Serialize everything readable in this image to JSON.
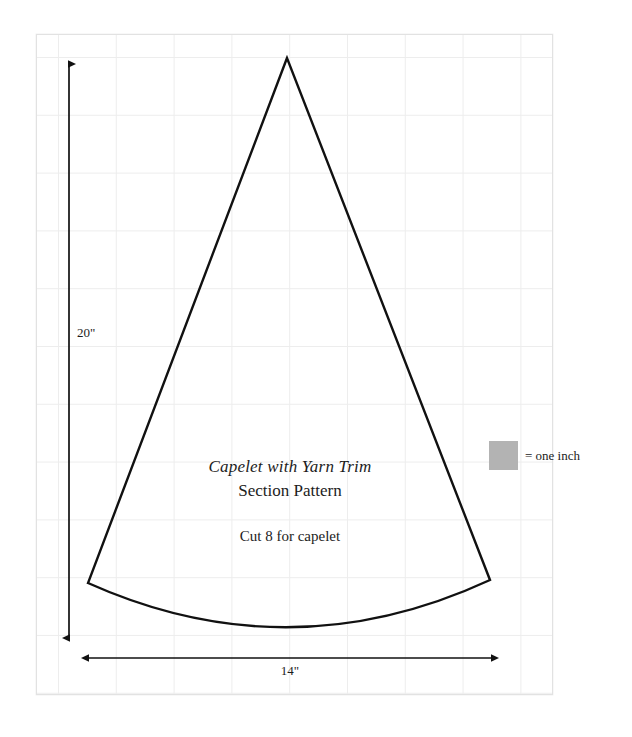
{
  "page": {
    "sheet_background": "#ffffff",
    "grid_color": "#ededed",
    "border_color": "#e2e2e2",
    "ink_color": "#1c1c1c"
  },
  "pattern": {
    "title": "Capelet with Yarn Trim",
    "subtitle": "Section Pattern",
    "cut_instruction": "Cut 8 for capelet",
    "shape_name": "cone-section-pattern"
  },
  "dimensions": {
    "height_label": "20\"",
    "width_label": "14\"",
    "height_inches": 20,
    "width_inches": 14
  },
  "legend": {
    "swatch_color": "#b3b3b3",
    "label": "= one inch",
    "swatch_size_px": 29
  }
}
